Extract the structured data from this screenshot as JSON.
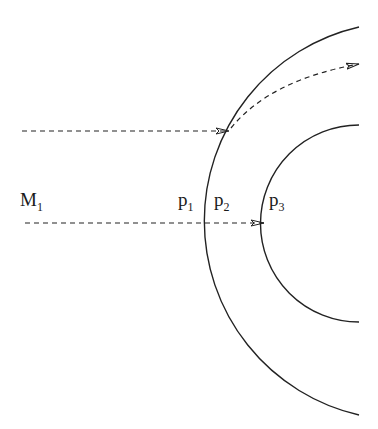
{
  "diagram": {
    "labels": {
      "m1": {
        "main": "M",
        "sub": "1"
      },
      "p1": {
        "main": "p",
        "sub": "1"
      },
      "p2": {
        "main": "p",
        "sub": "2"
      },
      "p3": {
        "main": "p",
        "sub": "3"
      }
    },
    "shapes": {
      "outer_arc": "outer circular boundary (arc, center off right edge)",
      "inner_arc": "inner circular boundary (arc, center at right edge)",
      "ray_upper": "dashed ray hitting outer arc and refracting upward-right",
      "ray_lower": "dashed ray along axis passing p1, p2 to p3"
    },
    "colors": {
      "stroke": "#222222",
      "background": "#ffffff"
    }
  }
}
